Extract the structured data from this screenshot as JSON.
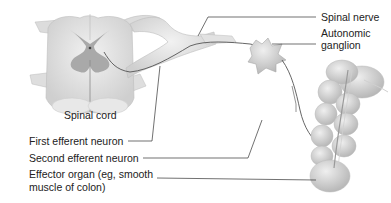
{
  "diagram": {
    "labels": {
      "spinal_cord": "Spinal cord",
      "spinal_nerve": "Spinal nerve",
      "autonomic_ganglion_line1": "Autonomic",
      "autonomic_ganglion_line2": "ganglion",
      "first_efferent_neuron": "First efferent neuron",
      "second_efferent_neuron": "Second efferent neuron",
      "effector_organ_line1": "Effector organ (eg, smooth",
      "effector_organ_line2": "muscle of colon)"
    },
    "colors": {
      "tissue_light": "#e6e6e6",
      "tissue_mid": "#c8c8c8",
      "gray_matter": "#a9a9a9",
      "neuron_line": "#555555",
      "leader_line": "#333333",
      "text": "#222222"
    }
  }
}
